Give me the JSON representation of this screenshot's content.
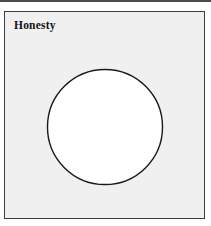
{
  "figure": {
    "title": "Honesty",
    "background_color": "#ffffff",
    "panel": {
      "fill_color": "#f0f0f0",
      "border_color": "#3d3d3d",
      "border_width_px": 1.6,
      "x": 4,
      "y": 11,
      "width": 201,
      "height": 208
    },
    "top_rule": {
      "color": "#4a4a4a",
      "height_px": 2
    },
    "shapes": [
      {
        "name": "circle",
        "type": "circle",
        "center_x": 100,
        "center_y": 115,
        "radius": 57.5,
        "fill_color": "#ffffff",
        "stroke_color": "#1a1a1a",
        "stroke_width_px": 1.4
      }
    ]
  }
}
